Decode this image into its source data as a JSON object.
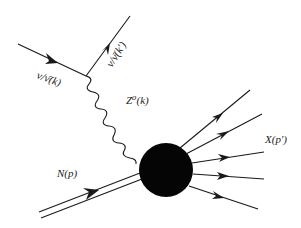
{
  "diagram": {
    "type": "feynman-diagram",
    "labels": {
      "incoming_lepton": "ν/ν̄(k)",
      "outgoing_lepton": "ν/ν̄(k′)",
      "boson": "Z⁰(k)",
      "incoming_nucleon": "N(p)",
      "final_state": "X(p′)"
    },
    "colors": {
      "line": "#1a1a1a",
      "blob": "#050505",
      "background": "#ffffff",
      "text": "#222222"
    },
    "elements": {
      "incoming_lepton_line": {
        "from": [
          18,
          44
        ],
        "to": [
          86,
          76
        ],
        "arrow": true
      },
      "outgoing_lepton_line": {
        "from": [
          86,
          76
        ],
        "to": [
          130,
          16
        ],
        "arrow": true
      },
      "boson_line": {
        "from": [
          86,
          76
        ],
        "to": [
          150,
          148
        ],
        "style": "wavy"
      },
      "nucleon_line": {
        "from": [
          40,
          215
        ],
        "to": [
          140,
          176
        ],
        "style": "double",
        "arrow": true
      },
      "blob": {
        "center": [
          166,
          170
        ],
        "radius": 27
      },
      "outgoing_hadrons": [
        {
          "to": [
            250,
            90
          ]
        },
        {
          "to": [
            262,
            114
          ]
        },
        {
          "to": [
            264,
            152
          ]
        },
        {
          "to": [
            264,
            179
          ]
        },
        {
          "to": [
            258,
            209
          ]
        }
      ]
    }
  }
}
